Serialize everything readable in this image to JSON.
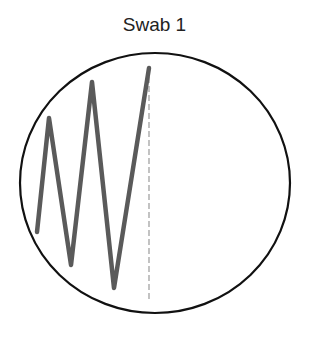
{
  "title": "Swab 1",
  "colors": {
    "background": "#ffffff",
    "plate_outline": "#111111",
    "streak": "#5a5a5a",
    "title_text": "#222222"
  },
  "plate": {
    "shape": "ellipse",
    "cx": 155,
    "cy": 183,
    "rx": 135,
    "ry": 130,
    "stroke_width": 2.2
  },
  "streak": {
    "points": [
      [
        37,
        232
      ],
      [
        49,
        118
      ],
      [
        71,
        265
      ],
      [
        92,
        82
      ],
      [
        114,
        288
      ],
      [
        149,
        68
      ]
    ],
    "stroke_width": 4.5
  },
  "faint_line": {
    "x1": 149,
    "y1": 68,
    "x2": 149,
    "y2": 300,
    "stroke_width": 1.2
  }
}
